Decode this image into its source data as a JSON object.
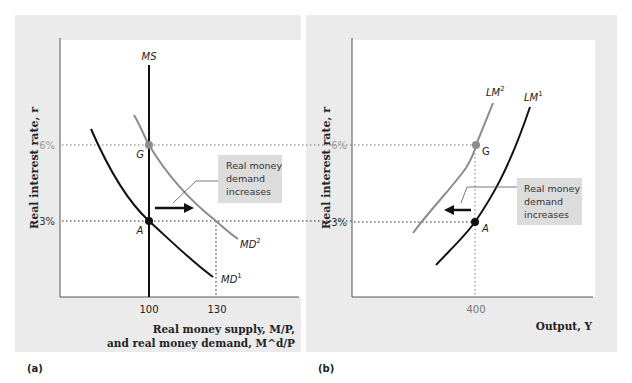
{
  "panel_a": {
    "label": "(a)",
    "y_axis_label": "Real interest rate, r",
    "x_axis_label_line1": "Real money supply, M/P,",
    "x_axis_label_line2": "and real money demand, M^d/P",
    "y_ticks": [
      "6%",
      "3%"
    ],
    "x_ticks": [
      "100",
      "130"
    ],
    "curves": {
      "ms": "MS",
      "md1": "MD",
      "md1_sup": "1",
      "md2": "MD",
      "md2_sup": "2"
    },
    "points": {
      "g": "G",
      "a": "A"
    },
    "callout": [
      "Real money",
      "demand",
      "increases"
    ]
  },
  "panel_b": {
    "label": "(b)",
    "y_axis_label": "Real interest rate, r",
    "x_axis_label": "Output, Y",
    "y_ticks": [
      "6%",
      "3%"
    ],
    "x_ticks": [
      "400"
    ],
    "curves": {
      "lm1": "LM",
      "lm1_sup": "1",
      "lm2": "LM",
      "lm2_sup": "2"
    },
    "points": {
      "g": "G",
      "a": "A"
    },
    "callout": [
      "Real money",
      "demand",
      "increases"
    ]
  },
  "colors": {
    "panel_bg": "#ebebeb",
    "plot_bg": "#ffffff",
    "curve_dark": "#111111",
    "curve_light": "#8c8c8c",
    "callout_bg": "#dcdcdc",
    "tick_6pct": "#9a9a9a"
  }
}
